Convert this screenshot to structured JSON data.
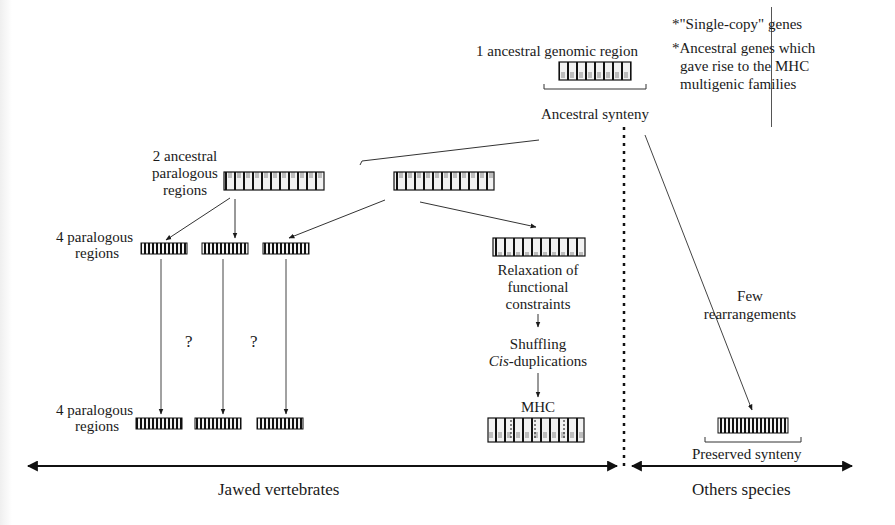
{
  "figure": {
    "top": {
      "root_label": "1 ancestral genomic region",
      "root_caption": "Ancestral synteny"
    },
    "legend": {
      "items": [
        "*\"Single-copy\" genes",
        "*Ancestral genes which",
        "gave rise to the MHC",
        "multigenic families"
      ]
    },
    "level2": {
      "label_line1": "2 ancestral",
      "label_line2": "paralogous",
      "label_line3": "regions"
    },
    "level3": {
      "label_line1": "4 paralogous",
      "label_line2": "regions"
    },
    "level4": {
      "label_line1": "4 paralogous",
      "label_line2": "regions"
    },
    "unknowns": [
      "?",
      "?"
    ],
    "mhc_branch": {
      "relax_line1": "Relaxation of",
      "relax_line2": "functional",
      "relax_line3": "constraints",
      "shuffling": "Shuffling",
      "cis_italic": "Cis",
      "cis_rest": "-duplications",
      "mhc_label": "MHC"
    },
    "other_branch": {
      "few_line1": "Few",
      "few_line2": "rearrangements",
      "preserved_caption": "Preserved synteny"
    },
    "axis": {
      "left_group": "Jawed vertebrates",
      "right_group": "Others species"
    }
  }
}
